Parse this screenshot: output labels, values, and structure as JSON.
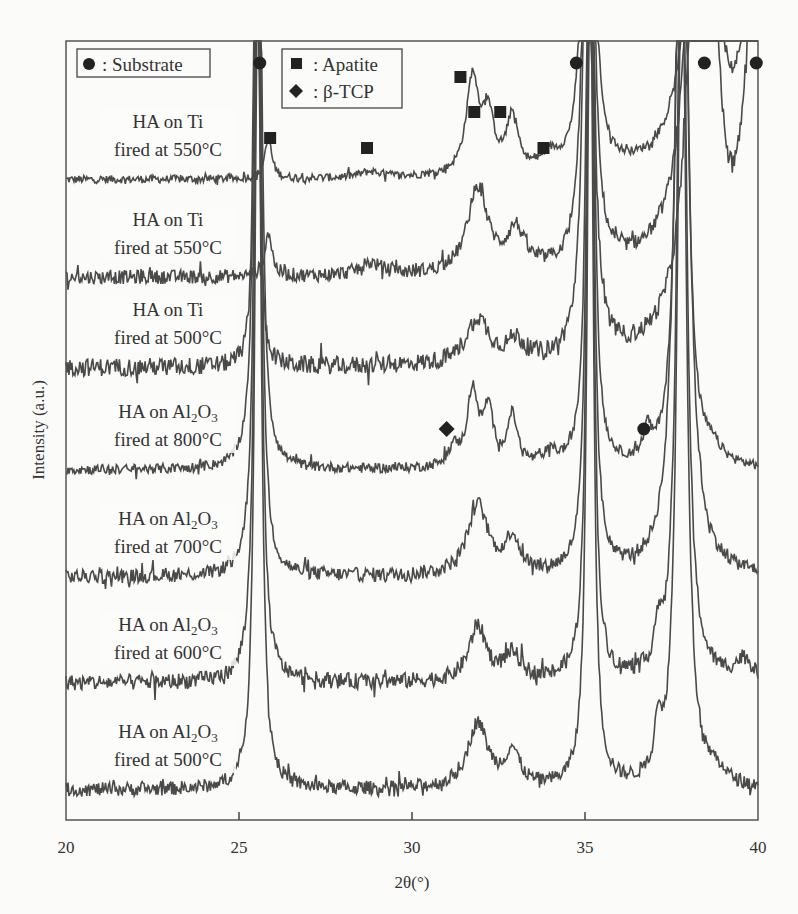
{
  "chart_data": {
    "type": "line",
    "title": "",
    "xlabel": "2θ(°)",
    "ylabel": "Intensity (a.u.)",
    "xlim": [
      20,
      40
    ],
    "x_ticks": [
      20,
      25,
      30,
      35,
      40
    ],
    "grid": false,
    "legend": [
      {
        "marker": "circle",
        "label": ": Substrate"
      },
      {
        "marker": "square",
        "label": ": Apatite"
      },
      {
        "marker": "diamond",
        "label": ": β-TCP"
      }
    ],
    "series": [
      {
        "name": "HA on Ti fired at 550°C",
        "label_line1": "HA on Ti",
        "label_line2": "fired at 550°C",
        "baseline_y": 180,
        "noise": 4,
        "peaks": [
          [
            25.85,
            40,
            0.12
          ],
          [
            28.8,
            6,
            0.4
          ],
          [
            31.75,
            95,
            0.22
          ],
          [
            32.2,
            55,
            0.2
          ],
          [
            32.9,
            55,
            0.2
          ],
          [
            34.0,
            14,
            0.3
          ],
          [
            35.1,
            900,
            0.12
          ],
          [
            38.4,
            900,
            0.25
          ],
          [
            40.2,
            900,
            0.35
          ]
        ]
      },
      {
        "name": "HA on Ti fired at 550°C",
        "label_line1": "HA on Ti",
        "label_line2": "fired at 550°C",
        "baseline_y": 278,
        "noise": 7,
        "peaks": [
          [
            25.85,
            45,
            0.12
          ],
          [
            28.8,
            12,
            0.4
          ],
          [
            31.9,
            85,
            0.35
          ],
          [
            33.0,
            40,
            0.3
          ],
          [
            35.1,
            900,
            0.12
          ],
          [
            38.4,
            900,
            0.3
          ],
          [
            40.2,
            900,
            0.35
          ]
        ]
      },
      {
        "name": "HA on Ti fired at 500°C",
        "label_line1": "HA on Ti",
        "label_line2": "fired at 500°C",
        "baseline_y": 368,
        "noise": 9,
        "peaks": [
          [
            25.5,
            900,
            0.06
          ],
          [
            31.9,
            45,
            0.4
          ],
          [
            33.0,
            20,
            0.3
          ],
          [
            35.1,
            900,
            0.12
          ],
          [
            38.4,
            900,
            0.3
          ],
          [
            40.2,
            900,
            0.35
          ]
        ]
      },
      {
        "name": "HA on Al2O3 fired at 800°C",
        "label_line1": "HA on Al",
        "label_sub1": "2",
        "label_mid": "O",
        "label_sub2": "3",
        "label_line2": "fired at 800°C",
        "baseline_y": 470,
        "noise": 5,
        "peaks": [
          [
            25.55,
            900,
            0.1
          ],
          [
            31.2,
            18,
            0.2
          ],
          [
            31.75,
            75,
            0.18
          ],
          [
            32.2,
            55,
            0.18
          ],
          [
            32.9,
            50,
            0.18
          ],
          [
            34.0,
            12,
            0.25
          ],
          [
            35.15,
            900,
            0.1
          ],
          [
            36.8,
            28,
            0.12
          ],
          [
            37.8,
            900,
            0.15
          ],
          [
            38.7,
            12,
            0.3
          ]
        ]
      },
      {
        "name": "HA on Al2O3 fired at 700°C",
        "label_line1": "HA on Al",
        "label_sub1": "2",
        "label_mid": "O",
        "label_sub2": "3",
        "label_line2": "fired at 700°C",
        "baseline_y": 577,
        "noise": 7,
        "peaks": [
          [
            25.55,
            900,
            0.1
          ],
          [
            31.9,
            70,
            0.35
          ],
          [
            32.9,
            35,
            0.25
          ],
          [
            35.15,
            900,
            0.1
          ],
          [
            37.8,
            900,
            0.2
          ]
        ]
      },
      {
        "name": "HA on Al2O3 fired at 600°C",
        "label_line1": "HA on Al",
        "label_sub1": "2",
        "label_mid": "O",
        "label_sub2": "3",
        "label_line2": "fired at 600°C",
        "baseline_y": 683,
        "noise": 8,
        "peaks": [
          [
            25.55,
            900,
            0.1
          ],
          [
            31.9,
            55,
            0.3
          ],
          [
            32.9,
            25,
            0.3
          ],
          [
            35.15,
            900,
            0.1
          ],
          [
            37.1,
            40,
            0.1
          ],
          [
            37.8,
            900,
            0.15
          ],
          [
            39.6,
            20,
            0.3
          ]
        ]
      },
      {
        "name": "HA on Al2O3 fired at 500°C",
        "label_line1": "HA on Al",
        "label_sub1": "2",
        "label_mid": "O",
        "label_sub2": "3",
        "label_line2": "fired at 500°C",
        "baseline_y": 790,
        "noise": 7,
        "peaks": [
          [
            25.55,
            900,
            0.1
          ],
          [
            31.9,
            65,
            0.35
          ],
          [
            32.9,
            35,
            0.25
          ],
          [
            35.15,
            900,
            0.1
          ],
          [
            37.1,
            50,
            0.1
          ],
          [
            37.8,
            900,
            0.15
          ],
          [
            38.8,
            12,
            0.3
          ]
        ]
      }
    ],
    "markers": [
      {
        "type": "circle",
        "x": 25.6,
        "y_px": 63
      },
      {
        "type": "circle",
        "x": 34.75,
        "y_px": 63
      },
      {
        "type": "circle",
        "x": 38.45,
        "y_px": 63
      },
      {
        "type": "circle",
        "x": 39.95,
        "y_px": 63
      },
      {
        "type": "circle",
        "x": 36.7,
        "y_px": 429
      },
      {
        "type": "square",
        "x": 25.9,
        "y_px": 138
      },
      {
        "type": "square",
        "x": 28.7,
        "y_px": 148
      },
      {
        "type": "square",
        "x": 31.4,
        "y_px": 77
      },
      {
        "type": "square",
        "x": 31.8,
        "y_px": 112
      },
      {
        "type": "square",
        "x": 32.55,
        "y_px": 112
      },
      {
        "type": "square",
        "x": 33.8,
        "y_px": 148
      },
      {
        "type": "diamond",
        "x": 31.0,
        "y_px": 429
      }
    ]
  },
  "labels": {
    "xlabel": "2θ(°)",
    "ylabel": "Intensity (a.u.)",
    "legend_substrate": ": Substrate",
    "legend_apatite": ": Apatite",
    "legend_tcp": ": β-TCP"
  }
}
